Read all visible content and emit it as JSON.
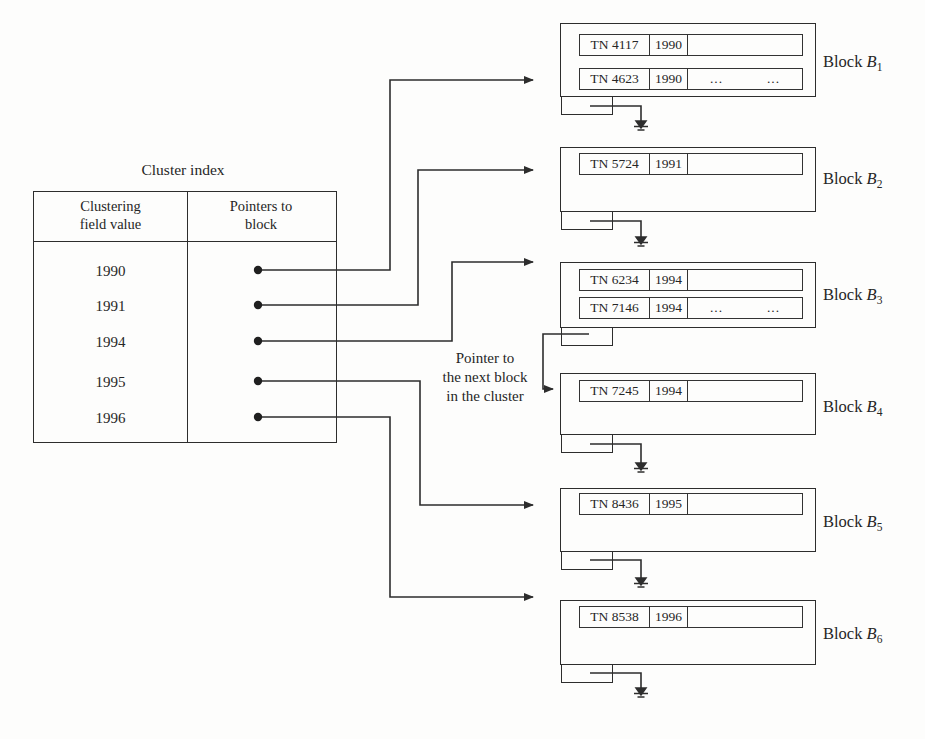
{
  "diagram": {
    "title": "Cluster index",
    "index_table": {
      "col1_header": [
        "Clustering",
        "field value"
      ],
      "col2_header": [
        "Pointers to",
        "block"
      ],
      "values": [
        "1990",
        "1991",
        "1994",
        "1995",
        "1996"
      ]
    },
    "annotation": [
      "Pointer to",
      "the next block",
      "in the cluster"
    ],
    "ink_color": "#2d2d2d",
    "blocks": [
      {
        "label_prefix": "Block ",
        "label_base": "B",
        "label_sub": "1",
        "records": [
          {
            "name": "TN 4117",
            "year": "1990",
            "extra1": "",
            "extra2": ""
          },
          {
            "name": "TN 4623",
            "year": "1990",
            "extra1": "...",
            "extra2": "..."
          }
        ]
      },
      {
        "label_prefix": "Block ",
        "label_base": "B",
        "label_sub": "2",
        "records": [
          {
            "name": "TN 5724",
            "year": "1991",
            "extra1": "",
            "extra2": ""
          }
        ]
      },
      {
        "label_prefix": "Block ",
        "label_base": "B",
        "label_sub": "3",
        "records": [
          {
            "name": "TN 6234",
            "year": "1994",
            "extra1": "",
            "extra2": ""
          },
          {
            "name": "TN 7146",
            "year": "1994",
            "extra1": "...",
            "extra2": "..."
          }
        ]
      },
      {
        "label_prefix": "Block ",
        "label_base": "B",
        "label_sub": "4",
        "records": [
          {
            "name": "TN 7245",
            "year": "1994",
            "extra1": "",
            "extra2": ""
          }
        ]
      },
      {
        "label_prefix": "Block ",
        "label_base": "B",
        "label_sub": "5",
        "records": [
          {
            "name": "TN 8436",
            "year": "1995",
            "extra1": "",
            "extra2": ""
          }
        ]
      },
      {
        "label_prefix": "Block ",
        "label_base": "B",
        "label_sub": "6",
        "records": [
          {
            "name": "TN 8538",
            "year": "1996",
            "extra1": "",
            "extra2": ""
          }
        ]
      }
    ]
  }
}
